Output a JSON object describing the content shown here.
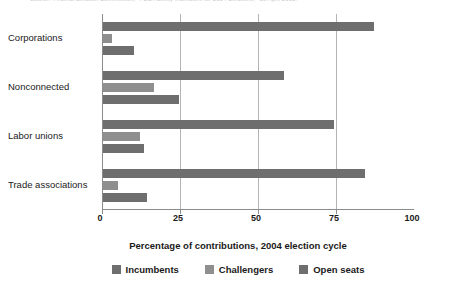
{
  "source_caption": "Source: Federal Election Commission, \"FEC Activity Increases for 2004 Elections,\" 13 April 2005.",
  "chart_data": {
    "type": "bar",
    "orientation": "horizontal",
    "title": "",
    "xlabel": "Percentage of contributions, 2004 election cycle",
    "ylabel": "",
    "xlim": [
      0,
      100
    ],
    "xticks": [
      0,
      25,
      50,
      75,
      100
    ],
    "xtick_labels": [
      "0",
      "25",
      "50",
      "75",
      "100"
    ],
    "grid": "vertical",
    "legend_position": "bottom",
    "categories": [
      "Corporations",
      "Nonconnected",
      "Labor unions",
      "Trade associations"
    ],
    "series": [
      {
        "name": "Incumbents",
        "color": "#6e6e6e",
        "values": [
          87,
          58,
          74,
          84
        ]
      },
      {
        "name": "Challengers",
        "color": "#8f8f8f",
        "values": [
          3,
          16.5,
          12,
          4.7
        ]
      },
      {
        "name": "Open seats",
        "color": "#6e6e6e",
        "values": [
          10,
          24.5,
          13,
          14
        ]
      }
    ]
  }
}
